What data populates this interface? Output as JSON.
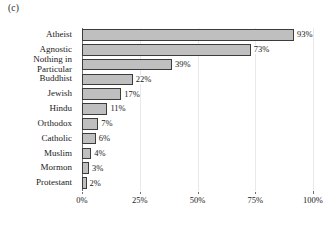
{
  "panel": {
    "label": "(c)"
  },
  "chart_data": {
    "type": "bar",
    "orientation": "horizontal",
    "title": "",
    "xlabel": "",
    "ylabel": "",
    "categories": [
      "Atheist",
      "Agnostic",
      "Nothing in\nParticular",
      "Buddhist",
      "Jewish",
      "Hindu",
      "Orthodox",
      "Catholic",
      "Muslim",
      "Mormon",
      "Protestant"
    ],
    "values": [
      93,
      73,
      39,
      22,
      17,
      11,
      7,
      6,
      4,
      3,
      2
    ],
    "value_labels": [
      "93%",
      "73%",
      "39%",
      "22%",
      "17%",
      "11%",
      "7%",
      "6%",
      "4%",
      "3%",
      "2%"
    ],
    "xlim": [
      0,
      100
    ],
    "xticks": [
      0,
      25,
      50,
      75,
      100
    ],
    "xtick_labels": [
      "0%",
      "25%",
      "50%",
      "75%",
      "100%"
    ],
    "grid": true,
    "legend": false,
    "bar_fill_color": "#bfbfbf",
    "bar_edge_color": "#3c3c3c",
    "grid_color": "#e9e9ec",
    "axis_color": "#6f6f6f"
  }
}
